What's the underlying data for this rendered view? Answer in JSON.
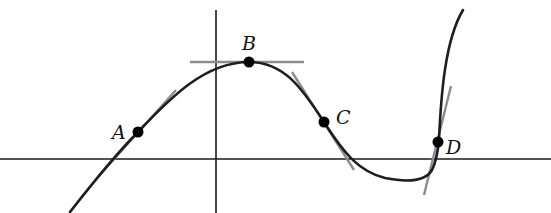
{
  "diagram": {
    "type": "function-graph-with-tangent-lines",
    "axes": {
      "x_axis": {
        "y": 159,
        "x_start": 0,
        "x_end": 551
      },
      "y_axis": {
        "x": 216,
        "y_start": 10,
        "y_end": 213
      }
    },
    "curve": {
      "description": "smooth curve rising through A to a maximum at B, falling through C, dipping below x-axis to a minimum, then rising steeply through D",
      "color": "#1e1e1e"
    },
    "points": [
      {
        "id": "A",
        "label": "A",
        "x": 138,
        "y": 132,
        "tangent": "positive slope"
      },
      {
        "id": "B",
        "label": "B",
        "x": 249,
        "y": 62,
        "tangent": "horizontal (zero slope)"
      },
      {
        "id": "C",
        "label": "C",
        "x": 324,
        "y": 122,
        "tangent": "negative slope"
      },
      {
        "id": "D",
        "label": "D",
        "x": 438,
        "y": 142,
        "tangent": "steep positive slope"
      }
    ],
    "tangent_color": "#8c8c8c"
  },
  "labels": {
    "A": "A",
    "B": "B",
    "C": "C",
    "D": "D"
  }
}
